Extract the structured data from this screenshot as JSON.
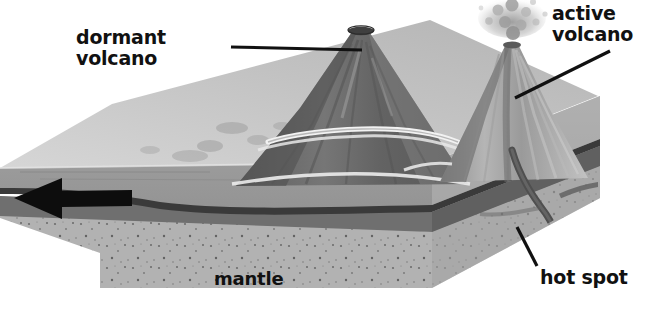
{
  "figure": {
    "type": "geology-cross-section-diagram",
    "background_color": "#ffffff",
    "width": 656,
    "height": 315
  },
  "labels": {
    "dormant_volcano": "dormant\nvolcano",
    "active_volcano": "active\nvolcano",
    "hot_spot": "hot spot",
    "mantle": "mantle"
  },
  "leader_lines": [
    {
      "name": "dormant-volcano-leader",
      "from_x": 231,
      "from_y": 47,
      "to_x": 362,
      "to_y": 50
    },
    {
      "name": "active-volcano-leader",
      "from_x": 610,
      "from_y": 51,
      "to_x": 515,
      "to_y": 98
    },
    {
      "name": "hot-spot-leader",
      "from_x": 517,
      "from_y": 227,
      "to_x": 536,
      "to_y": 266
    }
  ],
  "plate_motion_arrow": {
    "name": "plate-motion-arrow",
    "direction": "left",
    "tip_x": 14,
    "tip_y": 198,
    "tail_x": 132,
    "tail_y": 198,
    "color": "#111111"
  },
  "features": {
    "dormant_volcano": {
      "summit_x": 360,
      "summit_y": 28,
      "base_y": 185,
      "fill": "#6f6f6f",
      "has_crater": true,
      "has_shoreline_ring": true
    },
    "active_volcano": {
      "summit_x": 512,
      "summit_y": 40,
      "base_y": 180,
      "fill": "#8a8a8a",
      "has_eruption_plume": true,
      "plume_color": "#b8b8b8",
      "has_conduit": true,
      "conduit_color": "#4a4a4a"
    },
    "hot_spot": {
      "plume_top_x": 560,
      "plume_bottom_y": 290,
      "color": "#555555"
    }
  },
  "layers": [
    {
      "name": "ocean-floor-surface",
      "label": "",
      "color": "#c9c9c9"
    },
    {
      "name": "upper-crust",
      "label": "",
      "color": "#9a9a9a"
    },
    {
      "name": "crust-dark-band",
      "label": "",
      "color": "#3c3c3c"
    },
    {
      "name": "lower-lithosphere",
      "label": "",
      "color": "#6e6e6e"
    },
    {
      "name": "mantle-block",
      "label": "mantle",
      "color": "#aeaeae"
    }
  ],
  "palette": {
    "page_background": "#ffffff",
    "text": "#111111",
    "leader_line": "#111111",
    "top_surface": "#c6c6c6",
    "front_face_upper": "#9b9b9b",
    "dark_band": "#3a3a3a",
    "mid_band": "#707070",
    "mantle": "#b0b0b0",
    "mantle_speckle": "#6a6a6a",
    "volcano_dark": "#6a6a6a",
    "volcano_light": "#a8a8a8"
  }
}
